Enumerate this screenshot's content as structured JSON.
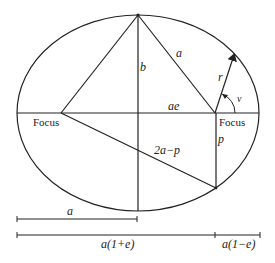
{
  "colors": {
    "stroke": "#222222",
    "background": "#ffffff"
  },
  "labels": {
    "focus_left": "Focus",
    "focus_right": "Focus",
    "semi_minor": "b",
    "semi_major_hyp": "a",
    "radius": "r",
    "true_anomaly": "ν",
    "ae": "ae",
    "two_a_minus_p": "2a−p",
    "p": "p",
    "scale_a": "a",
    "scale_periapsis_far": "a(1+e)",
    "scale_periapsis_near": "a(1−e)"
  }
}
